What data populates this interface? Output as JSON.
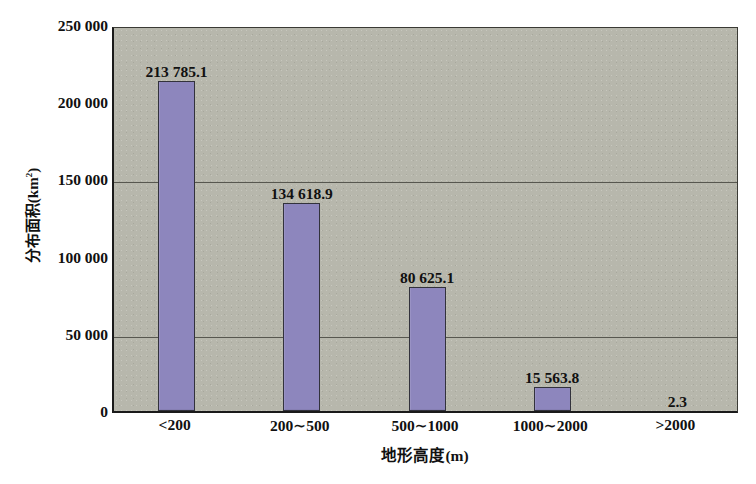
{
  "chart_data": {
    "type": "bar",
    "title": "",
    "categories": [
      "<200",
      "200∼500",
      "500∼1000",
      "1000∼2000",
      ">2000"
    ],
    "values": [
      213785.1,
      134618.9,
      80625.1,
      15563.8,
      2.3
    ],
    "data_labels": [
      "213 785.1",
      "134 618.9",
      "80 625.1",
      "15 563.8",
      "2.3"
    ],
    "xlabel": "地形高度(m)",
    "ylabel_prefix": "分布面积(km",
    "ylabel_sup": "2",
    "ylabel_suffix": ")",
    "ylabel": "分布面积(km²)",
    "ylim": [
      0,
      250000
    ],
    "yticks": [
      0,
      50000,
      100000,
      150000,
      200000,
      250000
    ],
    "ytick_labels": [
      "0",
      "50 000",
      "100 000",
      "150 000",
      "200 000",
      "250 000"
    ],
    "gridlines_at": [
      50000,
      150000
    ],
    "grid": true,
    "legend": false,
    "bar_color": "#8d86bd",
    "bar_edge_color": "#32323c",
    "plot_bg_color": "#b7b7ac",
    "axis_color": "#1a1a1a",
    "gridline_color": "#57574f",
    "text_color": "#111111"
  },
  "caption": {
    "text": ""
  }
}
